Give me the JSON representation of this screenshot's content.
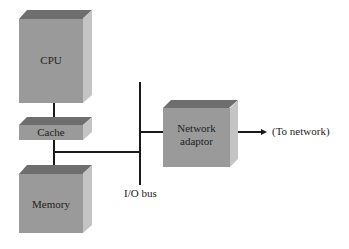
{
  "diagram": {
    "components": {
      "cpu": {
        "label": "CPU"
      },
      "cache": {
        "label": "Cache"
      },
      "memory": {
        "label": "Memory"
      },
      "network_adaptor": {
        "label_line1": "Network",
        "label_line2": "adaptor"
      }
    },
    "bus_label": "I/O bus",
    "network_label": "(To network)",
    "colors": {
      "front": "#9a9a9a",
      "top": "#6e6e6e",
      "side": "#c4c4c4",
      "line": "#1a1a1a"
    }
  }
}
